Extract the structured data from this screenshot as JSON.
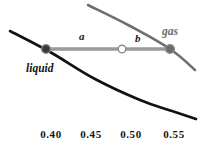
{
  "figure": {
    "background_color": "#ffffff",
    "width": 204,
    "height": 149
  },
  "colors": {
    "liquid_curve": "#111111",
    "gas_line": "#6e6e6e",
    "tie_line": "#9a9a9a",
    "liquid_node": "#3a3a3a",
    "gas_node": "#6b6b6b",
    "marker_open_fill": "#ffffff",
    "marker_open_stroke": "#8d8d8d",
    "tick_text": "#151515"
  },
  "labels": {
    "liquid": "liquid",
    "gas": "gas",
    "segment_a": "a",
    "segment_b": "b"
  },
  "axis": {
    "tick_labels": [
      "0.40",
      "0.45",
      "0.50",
      "0.55"
    ],
    "tick_x": [
      51,
      91,
      131,
      174
    ]
  },
  "chart_data": {
    "type": "line",
    "title": "",
    "xlabel": "",
    "ylabel": "",
    "grid": false,
    "legend": "inline-annotations",
    "xlim": [
      0.375,
      0.585
    ],
    "tick_values": [
      0.4,
      0.45,
      0.5,
      0.55
    ],
    "tick_labels": [
      "0.40",
      "0.45",
      "0.50",
      "0.55"
    ],
    "annotations": [
      {
        "text": "liquid",
        "x_px": 26,
        "y_px": 63,
        "style": "bold-italic",
        "color": "#141414"
      },
      {
        "text": "gas",
        "x_px": 162,
        "y_px": 26,
        "style": "bold-italic",
        "color": "#6e6e6e"
      },
      {
        "text": "a",
        "x_px": 79,
        "y_px": 31,
        "style": "bold-italic",
        "color": "#1a1a1a"
      },
      {
        "text": "b",
        "x_px": 135,
        "y_px": 33,
        "style": "bold-italic",
        "color": "#1a1a1a"
      }
    ],
    "series": [
      {
        "name": "liquid-curve",
        "color": "#111111",
        "width_px": 2.6,
        "points_px": [
          [
            10,
            31
          ],
          [
            50,
            52
          ],
          [
            95,
            79
          ],
          [
            140,
            100
          ],
          [
            172,
            111
          ],
          [
            196,
            119
          ]
        ]
      },
      {
        "name": "gas-line",
        "color": "#6e6e6e",
        "width_px": 2.6,
        "points_px": [
          [
            88,
            5
          ],
          [
            130,
            26
          ],
          [
            170,
            49
          ],
          [
            195,
            70
          ]
        ]
      },
      {
        "name": "tie-line",
        "color": "#9a9a9a",
        "width_px": 3.6,
        "points_px": [
          [
            46,
            49
          ],
          [
            170,
            49
          ]
        ]
      }
    ],
    "markers": [
      {
        "name": "liquid-node",
        "x_px": 46,
        "y_px": 49,
        "r_px": 4.4,
        "fill": "#3a3a3a",
        "stroke": "#8c8c8c"
      },
      {
        "name": "overall-composition-node",
        "x_px": 122,
        "y_px": 49,
        "r_px": 3.8,
        "fill": "#ffffff",
        "stroke": "#8d8d8d"
      },
      {
        "name": "gas-node",
        "x_px": 170,
        "y_px": 49,
        "r_px": 4.4,
        "fill": "#6b6b6b",
        "stroke": "#8c8c8c"
      }
    ]
  }
}
